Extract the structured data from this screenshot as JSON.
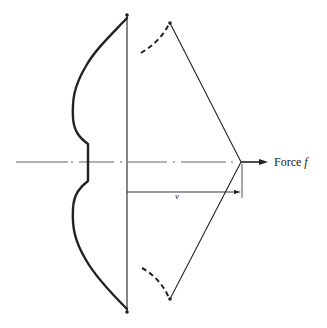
{
  "diagram": {
    "labels": {
      "force": "Force",
      "force_symbol": "f",
      "displacement": "v"
    },
    "colors": {
      "stroke": "#222222",
      "background": "#ffffff"
    },
    "elements": [
      "bow-limbs-braced",
      "bowstring-braced",
      "bow-limb-tips-drawn-dashed",
      "bowstring-drawn",
      "centerline-dash-dot",
      "force-arrow",
      "displacement-dimension"
    ]
  }
}
